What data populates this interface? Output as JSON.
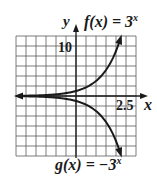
{
  "chart_data": {
    "type": "line",
    "title": "",
    "xlabel": "x",
    "ylabel": "y",
    "xlim": [
      -3,
      3
    ],
    "ylim": [
      -12,
      12
    ],
    "grid": true,
    "x_tick_label": "2.5",
    "y_tick_label": "10",
    "x_grid_step": 0.5,
    "y_grid_step": 2,
    "series": [
      {
        "name": "f(x) = 3^x",
        "label": "f(x) = 3",
        "exponent": "x",
        "x": [
          -3,
          -2,
          -1,
          0,
          0.5,
          1,
          1.5,
          2,
          2.25
        ],
        "values": [
          0.037,
          0.111,
          0.333,
          1,
          1.73,
          3,
          5.2,
          9,
          11.8
        ]
      },
      {
        "name": "g(x) = -3^x",
        "label": "g(x) = −3",
        "exponent": "x",
        "x": [
          -3,
          -2,
          -1,
          0,
          0.5,
          1,
          1.5,
          2,
          2.25
        ],
        "values": [
          -0.037,
          -0.111,
          -0.333,
          -1,
          -1.73,
          -3,
          -5.2,
          -9,
          -11.8
        ]
      }
    ]
  },
  "labels": {
    "y_axis": "y",
    "x_axis": "x",
    "f_label": "f(x) = 3",
    "f_exp": "x",
    "g_label": "g(x) = −3",
    "g_exp": "x",
    "tick_10": "10",
    "tick_2_5": "2.5"
  },
  "colors": {
    "curve": "#1a1a1a",
    "grid": "#555555",
    "background": "#ffffff"
  }
}
